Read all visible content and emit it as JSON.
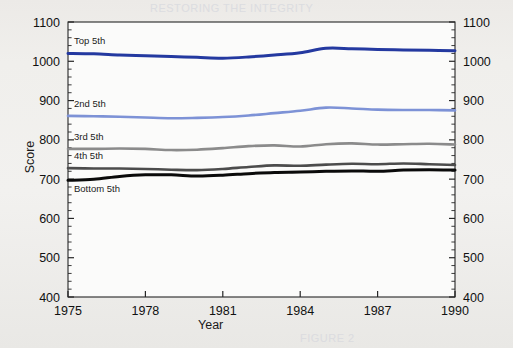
{
  "figure": {
    "background_color": "#eeedea",
    "plot_background_color": "#fbfbfa",
    "ghost_text_top": "RESTORING THE INTEGRITY",
    "ghost_text_mid1": "MEAN COMBINED SAT SCORES",
    "ghost_text_mid2": "BY FAMILY INCOME QUINTILE",
    "ghost_text_bottom": "FIGURE 2"
  },
  "chart_data": {
    "type": "line",
    "title": "",
    "xlabel": "Year",
    "ylabel": "Score",
    "xlim": [
      1975,
      1990
    ],
    "ylim": [
      400,
      1100
    ],
    "xticks": [
      1975,
      1978,
      1981,
      1984,
      1987,
      1990
    ],
    "yticks": [
      400,
      500,
      600,
      700,
      800,
      900,
      1000,
      1100
    ],
    "y_minor_tick_step": 20,
    "grid": false,
    "legend": "inline-labels",
    "x": [
      1975,
      1976,
      1977,
      1978,
      1979,
      1980,
      1981,
      1982,
      1983,
      1984,
      1985,
      1986,
      1987,
      1988,
      1989,
      1990
    ],
    "series": [
      {
        "name": "Top 5th",
        "label": "Top 5th",
        "color": "#2439a0",
        "width": 3.0,
        "values": [
          1020,
          1019,
          1016,
          1014,
          1012,
          1010,
          1008,
          1011,
          1016,
          1022,
          1033,
          1032,
          1030,
          1029,
          1028,
          1027
        ]
      },
      {
        "name": "2nd 5th",
        "label": "2nd 5th",
        "color": "#7d92d6",
        "width": 2.6,
        "values": [
          861,
          860,
          859,
          857,
          855,
          856,
          858,
          862,
          868,
          874,
          882,
          880,
          877,
          876,
          876,
          875
        ]
      },
      {
        "name": "3rd 5th",
        "label": "3rd 5th",
        "color": "#8b8b8b",
        "width": 2.6,
        "values": [
          777,
          777,
          778,
          777,
          774,
          775,
          779,
          784,
          786,
          783,
          789,
          791,
          788,
          789,
          790,
          788
        ]
      },
      {
        "name": "4th 5th",
        "label": "4th 5th",
        "color": "#4c4c4c",
        "width": 2.6,
        "values": [
          728,
          727,
          727,
          726,
          724,
          723,
          726,
          731,
          735,
          734,
          737,
          739,
          738,
          740,
          738,
          736
        ]
      },
      {
        "name": "Bottom 5th",
        "label": "Bottom 5th",
        "color": "#0a0a0a",
        "width": 3.0,
        "values": [
          697,
          700,
          707,
          711,
          711,
          708,
          710,
          714,
          717,
          718,
          720,
          721,
          720,
          723,
          724,
          723
        ]
      }
    ]
  }
}
